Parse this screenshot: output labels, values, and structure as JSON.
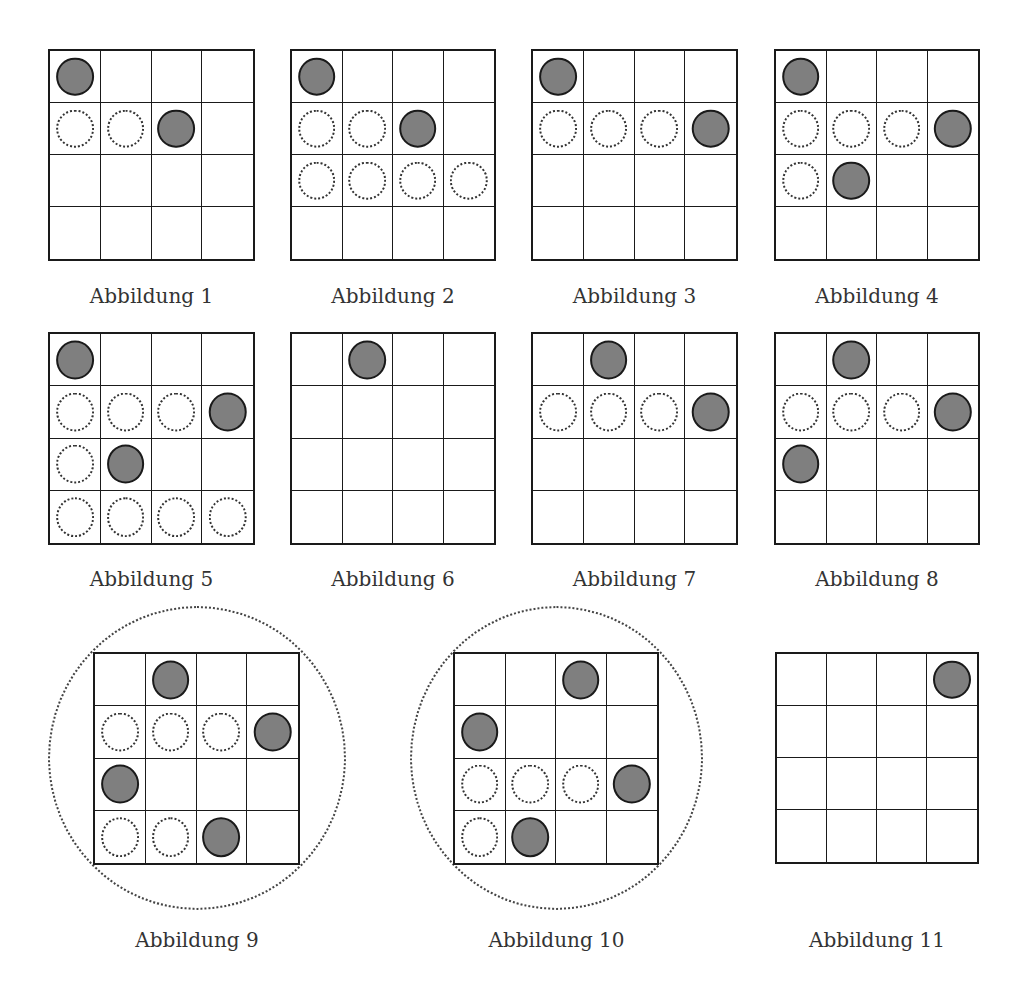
{
  "figures": [
    {
      "caption": "Abbildung 1",
      "x": 48,
      "y": 49,
      "w": 207,
      "h": 212,
      "ring": null,
      "cells": [
        [
          "F",
          "",
          "",
          ""
        ],
        [
          "D",
          "D",
          "F",
          ""
        ],
        [
          "",
          "",
          "",
          ""
        ],
        [
          "",
          "",
          "",
          ""
        ]
      ]
    },
    {
      "caption": "Abbildung 2",
      "x": 290,
      "y": 49,
      "w": 206,
      "h": 212,
      "ring": null,
      "cells": [
        [
          "F",
          "",
          "",
          ""
        ],
        [
          "D",
          "D",
          "F",
          ""
        ],
        [
          "D",
          "D",
          "D",
          "D"
        ],
        [
          "",
          "",
          "",
          ""
        ]
      ]
    },
    {
      "caption": "Abbildung 3",
      "x": 531,
      "y": 49,
      "w": 207,
      "h": 212,
      "ring": null,
      "cells": [
        [
          "F",
          "",
          "",
          ""
        ],
        [
          "D",
          "D",
          "D",
          "F"
        ],
        [
          "",
          "",
          "",
          ""
        ],
        [
          "",
          "",
          "",
          ""
        ]
      ]
    },
    {
      "caption": "Abbildung 4",
      "x": 774,
      "y": 49,
      "w": 206,
      "h": 212,
      "ring": null,
      "cells": [
        [
          "F",
          "",
          "",
          ""
        ],
        [
          "D",
          "D",
          "D",
          "F"
        ],
        [
          "D",
          "F",
          "",
          ""
        ],
        [
          "",
          "",
          "",
          ""
        ]
      ]
    },
    {
      "caption": "Abbildung 5",
      "x": 48,
      "y": 332,
      "w": 207,
      "h": 213,
      "ring": null,
      "cells": [
        [
          "F",
          "",
          "",
          ""
        ],
        [
          "D",
          "D",
          "D",
          "F"
        ],
        [
          "D",
          "F",
          "",
          ""
        ],
        [
          "D",
          "D",
          "D",
          "D"
        ]
      ]
    },
    {
      "caption": "Abbildung 6",
      "x": 290,
      "y": 332,
      "w": 206,
      "h": 213,
      "ring": null,
      "cells": [
        [
          "",
          "F",
          "",
          ""
        ],
        [
          "",
          "",
          "",
          ""
        ],
        [
          "",
          "",
          "",
          ""
        ],
        [
          "",
          "",
          "",
          ""
        ]
      ]
    },
    {
      "caption": "Abbildung 7",
      "x": 531,
      "y": 332,
      "w": 207,
      "h": 213,
      "ring": null,
      "cells": [
        [
          "",
          "F",
          "",
          ""
        ],
        [
          "D",
          "D",
          "D",
          "F"
        ],
        [
          "",
          "",
          "",
          ""
        ],
        [
          "",
          "",
          "",
          ""
        ]
      ]
    },
    {
      "caption": "Abbildung 8",
      "x": 774,
      "y": 332,
      "w": 206,
      "h": 213,
      "ring": null,
      "cells": [
        [
          "",
          "F",
          "",
          ""
        ],
        [
          "D",
          "D",
          "D",
          "F"
        ],
        [
          "F",
          "",
          "",
          ""
        ],
        [
          "",
          "",
          "",
          ""
        ]
      ]
    },
    {
      "caption": "Abbildung 9",
      "x": 93,
      "y": 652,
      "w": 207,
      "h": 213,
      "ring": {
        "x": 48,
        "y": 606,
        "w": 298,
        "h": 304
      },
      "cells": [
        [
          "",
          "F",
          "",
          ""
        ],
        [
          "D",
          "D",
          "D",
          "F"
        ],
        [
          "F",
          "",
          "",
          ""
        ],
        [
          "D",
          "D",
          "F",
          ""
        ]
      ]
    },
    {
      "caption": "Abbildung 10",
      "x": 453,
      "y": 652,
      "w": 206,
      "h": 213,
      "ring": {
        "x": 410,
        "y": 606,
        "w": 293,
        "h": 304
      },
      "cells": [
        [
          "",
          "",
          "F",
          ""
        ],
        [
          "F",
          "",
          "",
          ""
        ],
        [
          "D",
          "D",
          "D",
          "F"
        ],
        [
          "D",
          "F",
          "",
          ""
        ]
      ]
    },
    {
      "caption": "Abbildung 11",
      "x": 775,
      "y": 652,
      "w": 204,
      "h": 212,
      "ring": null,
      "cells": [
        [
          "",
          "",
          "",
          "F"
        ],
        [
          "",
          "",
          "",
          ""
        ],
        [
          "",
          "",
          "",
          ""
        ],
        [
          "",
          "",
          "",
          ""
        ]
      ]
    }
  ],
  "captions_y": [
    284,
    567,
    928
  ],
  "legend": {
    "F": "filled-piece",
    "D": "dotted-empty-position"
  },
  "colors": {
    "piece_fill": "#7f7f7f",
    "grid_line": "#1a1a1a",
    "caption": "#333333"
  }
}
